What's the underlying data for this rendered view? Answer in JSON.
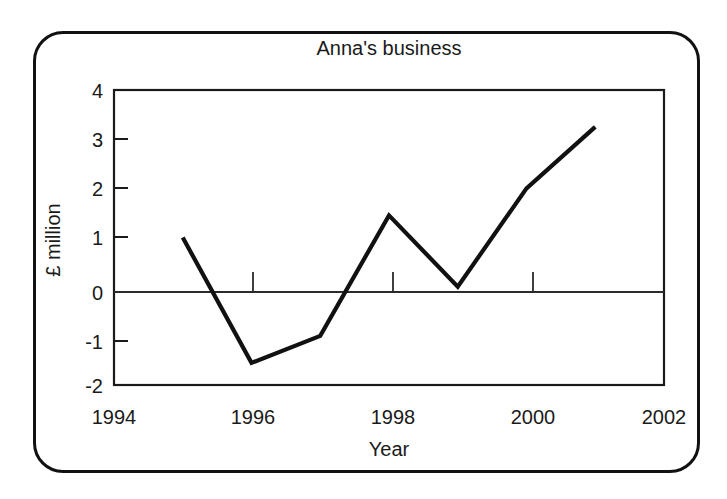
{
  "chart_data": {
    "type": "line",
    "title": "Anna's business",
    "xlabel": "Year",
    "ylabel": "£ million",
    "x": [
      1995,
      1996,
      1997,
      1998,
      1999,
      2000,
      2001
    ],
    "values": [
      1.0,
      -1.55,
      -1.0,
      1.45,
      0.0,
      2.0,
      3.25
    ],
    "series": [
      {
        "name": "Profit",
        "values": [
          1.0,
          -1.55,
          -1.0,
          1.45,
          0.0,
          2.0,
          3.25
        ]
      }
    ],
    "xlim": [
      1994,
      2002
    ],
    "ylim": [
      -2,
      4
    ],
    "x_tick_labels": [
      "1994",
      "1996",
      "1998",
      "2000",
      "2002"
    ],
    "x_tick_values": [
      1994,
      1996,
      1998,
      2000,
      2002
    ],
    "y_tick_labels": [
      "4",
      "3",
      "2",
      "1",
      "0",
      "-1",
      "-2"
    ],
    "y_tick_values": [
      4,
      3,
      2,
      1,
      0,
      -1,
      -2
    ],
    "grid": false,
    "legend": false,
    "zero_line": true,
    "line_color": "#111111",
    "axis_color": "#1a1a1a",
    "background_color": "#ffffff"
  }
}
